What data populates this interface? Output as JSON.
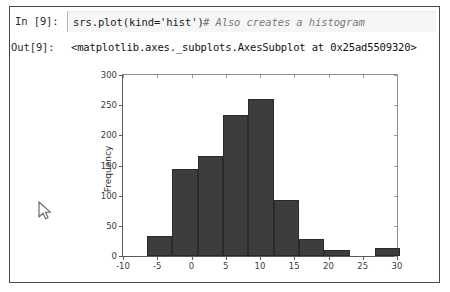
{
  "cell": {
    "input_prompt": "In [9]:",
    "output_prompt": "Out[9]:",
    "code": "srs.plot(kind='hist')",
    "comment": "# Also creates a histogram",
    "output": "<matplotlib.axes._subplots.AxesSubplot at 0x25ad5509320>"
  },
  "icons": {
    "cursor": "mouse-pointer-icon"
  },
  "colors": {
    "bar_fill": "#3d3d3d",
    "bar_edge": "#2a2a2a",
    "axis": "#5a5a5a",
    "input_background": "#f6f6f6",
    "cell_border": "#4a4a4a",
    "comment_text": "#7a7a7a"
  },
  "chart_data": {
    "type": "bar",
    "title": "",
    "xlabel": "",
    "ylabel": "Frequency",
    "xlim": [
      -10,
      30
    ],
    "ylim": [
      0,
      300
    ],
    "grid": false,
    "legend": null,
    "xticks": [
      -10,
      -5,
      0,
      5,
      10,
      15,
      20,
      25,
      30
    ],
    "yticks": [
      0,
      50,
      100,
      150,
      200,
      250,
      300
    ],
    "bin_edges": [
      -6.5,
      -2.8,
      0.9,
      4.6,
      8.3,
      12.0,
      15.7,
      19.4,
      23.1,
      26.8,
      30.5
    ],
    "categories": [
      "-6.5 to -2.8",
      "-2.8 to 0.9",
      "0.9 to 4.6",
      "4.6 to 8.3",
      "8.3 to 12.0",
      "12.0 to 15.7",
      "15.7 to 19.4",
      "19.4 to 23.1",
      "23.1 to 26.8",
      "26.8 to 30.5"
    ],
    "values": [
      34,
      145,
      166,
      233,
      261,
      93,
      28,
      10,
      0,
      13
    ]
  }
}
